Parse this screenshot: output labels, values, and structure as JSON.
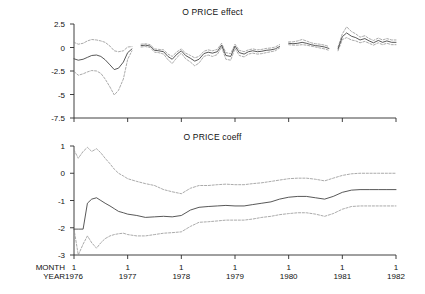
{
  "figure": {
    "background": "#ffffff",
    "line_color": "#3a3a3a",
    "band_color": "#8e8e8e",
    "axis_color": "#2b2b2b"
  },
  "axis_captions": {
    "month": "MONTH",
    "year": "YEAR"
  },
  "chart_data": [
    {
      "type": "line",
      "title": "O PRICE effect",
      "xlabel": "",
      "ylabel": "",
      "grid": false,
      "legend": "none",
      "ylim": [
        -7.5,
        2.5
      ],
      "yticks": [
        2.5,
        0,
        -2.5,
        -5,
        -7.5
      ],
      "ytick_labels": [
        "2.5",
        "0",
        "-2.5",
        "-5",
        "-7.5"
      ],
      "xlim": [
        1976.0,
        1982.0
      ],
      "xticks": [
        1976,
        1977,
        1978,
        1979,
        1980,
        1981,
        1982
      ],
      "xtick_month_labels": [
        "1",
        "1",
        "1",
        "1",
        "1",
        "1",
        "1"
      ],
      "xtick_year_labels": [
        "1976",
        "1977",
        "1978",
        "1979",
        "1980",
        "1981",
        "1982"
      ],
      "notes": "Rolling regression effect with upper/lower dashed confidence bands; data interrupted by gaps near 1977.1, 1980.0 and 1980.9.",
      "segments": [
        {
          "x": [
            1976.0,
            1976.08,
            1976.17,
            1976.25,
            1976.33,
            1976.42,
            1976.5,
            1976.58,
            1976.67,
            1976.75,
            1976.83,
            1976.92,
            1977.0,
            1977.08
          ],
          "estimate": [
            -1.2,
            -1.35,
            -1.25,
            -1.05,
            -0.85,
            -0.8,
            -0.95,
            -1.3,
            -1.85,
            -2.35,
            -2.2,
            -1.55,
            -0.55,
            -0.15
          ],
          "upper": [
            0.55,
            0.35,
            0.45,
            0.7,
            0.85,
            0.8,
            0.7,
            0.55,
            0.15,
            -0.35,
            -0.45,
            -0.35,
            0.05,
            0.1
          ],
          "lower": [
            -2.55,
            -2.95,
            -2.8,
            -2.6,
            -2.45,
            -2.5,
            -2.75,
            -3.35,
            -4.2,
            -5.05,
            -4.55,
            -3.35,
            -1.25,
            -0.35
          ]
        },
        {
          "x": [
            1977.25,
            1977.33,
            1977.42,
            1977.5,
            1977.58,
            1977.67,
            1977.75,
            1977.83,
            1977.92,
            1978.0,
            1978.08,
            1978.17,
            1978.25,
            1978.33,
            1978.42,
            1978.5,
            1978.58,
            1978.67,
            1978.75,
            1978.83,
            1978.92,
            1979.0,
            1979.08,
            1979.17,
            1979.25,
            1979.33,
            1979.42,
            1979.5,
            1979.58,
            1979.67,
            1979.75,
            1979.83
          ],
          "estimate": [
            0.2,
            0.25,
            0.15,
            -0.3,
            -0.35,
            -0.45,
            -0.95,
            -1.25,
            -0.7,
            -0.35,
            -0.85,
            -1.15,
            -1.45,
            -1.25,
            -0.65,
            -0.5,
            -0.6,
            -0.45,
            0.25,
            -0.85,
            -0.95,
            0.15,
            -0.55,
            -0.7,
            -0.45,
            -0.35,
            -0.45,
            -0.4,
            -0.3,
            -0.25,
            -0.15,
            0.1
          ],
          "upper": [
            0.35,
            0.4,
            0.3,
            -0.15,
            -0.2,
            -0.25,
            -0.7,
            -0.95,
            -0.45,
            -0.15,
            -0.6,
            -0.85,
            -1.1,
            -0.95,
            -0.4,
            -0.25,
            -0.35,
            -0.2,
            0.45,
            -0.55,
            -0.65,
            0.35,
            -0.3,
            -0.45,
            -0.25,
            -0.15,
            -0.25,
            -0.2,
            -0.1,
            -0.05,
            0.05,
            0.3
          ],
          "lower": [
            0.05,
            0.1,
            0.0,
            -0.5,
            -0.55,
            -0.7,
            -1.3,
            -1.7,
            -1.05,
            -0.6,
            -1.2,
            -1.55,
            -1.95,
            -1.65,
            -0.95,
            -0.8,
            -0.95,
            -0.75,
            0.05,
            -1.25,
            -1.35,
            -0.1,
            -0.85,
            -1.0,
            -0.7,
            -0.6,
            -0.7,
            -0.65,
            -0.55,
            -0.45,
            -0.35,
            -0.05
          ]
        },
        {
          "x": [
            1980.0,
            1980.08,
            1980.17,
            1980.25,
            1980.33,
            1980.42,
            1980.5,
            1980.58,
            1980.67,
            1980.75
          ],
          "estimate": [
            0.45,
            0.4,
            0.45,
            0.55,
            0.45,
            0.3,
            0.2,
            0.15,
            0.05,
            -0.1
          ],
          "upper": [
            0.6,
            0.6,
            0.7,
            0.85,
            0.7,
            0.5,
            0.4,
            0.35,
            0.25,
            0.1
          ],
          "lower": [
            0.3,
            0.25,
            0.25,
            0.3,
            0.25,
            0.15,
            0.05,
            -0.05,
            -0.15,
            -0.3
          ]
        },
        {
          "x": [
            1980.92,
            1981.0,
            1981.08,
            1981.17,
            1981.25,
            1981.33,
            1981.42,
            1981.5,
            1981.58,
            1981.67,
            1981.75,
            1981.83,
            1981.92,
            1982.0
          ],
          "estimate": [
            -0.15,
            1.15,
            1.55,
            1.2,
            1.05,
            0.8,
            0.95,
            0.7,
            0.5,
            0.75,
            0.55,
            0.7,
            0.55,
            0.55
          ],
          "upper": [
            0.05,
            1.45,
            2.2,
            1.7,
            1.45,
            1.1,
            1.25,
            0.95,
            0.75,
            1.0,
            0.8,
            0.95,
            0.8,
            0.8
          ],
          "lower": [
            -0.35,
            0.85,
            1.05,
            0.8,
            0.7,
            0.5,
            0.65,
            0.45,
            0.25,
            0.5,
            0.3,
            0.45,
            0.3,
            0.3
          ]
        }
      ]
    },
    {
      "type": "line",
      "title": "O PRICE coeff",
      "xlabel": "",
      "ylabel": "",
      "grid": false,
      "legend": "none",
      "ylim": [
        -3,
        1
      ],
      "yticks": [
        1,
        0,
        -1,
        -2,
        -3
      ],
      "ytick_labels": [
        "1",
        "0",
        "-1",
        "-2",
        "-3"
      ],
      "xlim": [
        1976.0,
        1982.0
      ],
      "xticks": [
        1976,
        1977,
        1978,
        1979,
        1980,
        1981,
        1982
      ],
      "xtick_month_labels": [
        "1",
        "1",
        "1",
        "1",
        "1",
        "1",
        "1"
      ],
      "xtick_year_labels": [
        "1976",
        "1977",
        "1978",
        "1979",
        "1980",
        "1981",
        "1982"
      ],
      "notes": "Recursive coefficient estimate with dashed 95% confidence bands that narrow over time toward about -0.6.",
      "segments": [
        {
          "x": [
            1976.0,
            1976.08,
            1976.17,
            1976.25,
            1976.33,
            1976.42,
            1976.5,
            1976.58,
            1976.67,
            1976.75,
            1976.83,
            1976.92,
            1977.0,
            1977.17,
            1977.33,
            1977.5,
            1977.67,
            1977.83,
            1978.0,
            1978.17,
            1978.33,
            1978.5,
            1978.67,
            1978.83,
            1979.0,
            1979.17,
            1979.33,
            1979.5,
            1979.67,
            1979.83,
            1980.0,
            1980.17,
            1980.33,
            1980.5,
            1980.67,
            1980.83,
            1981.0,
            1981.17,
            1981.33,
            1981.5,
            1981.67,
            1981.83,
            1982.0
          ],
          "estimate": [
            -2.05,
            -2.05,
            -2.05,
            -1.1,
            -0.95,
            -0.9,
            -1.0,
            -1.1,
            -1.2,
            -1.3,
            -1.4,
            -1.45,
            -1.5,
            -1.55,
            -1.62,
            -1.6,
            -1.58,
            -1.6,
            -1.55,
            -1.35,
            -1.25,
            -1.22,
            -1.2,
            -1.18,
            -1.2,
            -1.2,
            -1.15,
            -1.1,
            -1.05,
            -0.95,
            -0.88,
            -0.85,
            -0.85,
            -0.9,
            -0.95,
            -0.85,
            -0.7,
            -0.62,
            -0.6,
            -0.6,
            -0.6,
            -0.6,
            -0.6
          ],
          "upper": [
            0.85,
            0.55,
            0.8,
            0.95,
            0.8,
            0.9,
            0.75,
            0.55,
            0.35,
            0.15,
            0.0,
            -0.1,
            -0.2,
            -0.3,
            -0.38,
            -0.45,
            -0.6,
            -0.68,
            -0.75,
            -0.55,
            -0.45,
            -0.45,
            -0.42,
            -0.4,
            -0.42,
            -0.42,
            -0.38,
            -0.35,
            -0.3,
            -0.25,
            -0.2,
            -0.18,
            -0.18,
            -0.22,
            -0.28,
            -0.18,
            -0.08,
            -0.02,
            0.0,
            0.0,
            0.0,
            0.0,
            0.0
          ],
          "lower": [
            -2.05,
            -3.0,
            -2.6,
            -2.3,
            -2.55,
            -2.75,
            -2.55,
            -2.4,
            -2.3,
            -2.25,
            -2.22,
            -2.2,
            -2.25,
            -2.3,
            -2.3,
            -2.25,
            -2.2,
            -2.18,
            -2.15,
            -1.95,
            -1.8,
            -1.78,
            -1.75,
            -1.72,
            -1.72,
            -1.72,
            -1.68,
            -1.62,
            -1.58,
            -1.52,
            -1.48,
            -1.45,
            -1.45,
            -1.5,
            -1.58,
            -1.48,
            -1.32,
            -1.22,
            -1.2,
            -1.2,
            -1.2,
            -1.2,
            -1.2
          ]
        }
      ]
    }
  ]
}
